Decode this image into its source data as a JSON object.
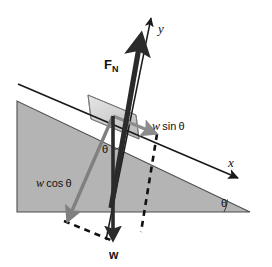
{
  "figure": {
    "kind": "free-body-diagram",
    "background_color": "#ffffff"
  },
  "colors": {
    "incline_fill": "#b4b4b4",
    "incline_stroke": "#4d4d4d",
    "block_fill": "#d8d8d8",
    "block_stroke": "#6e6e6e",
    "axis_line": "#1a1a1a",
    "normal_force_arrow": "#2b2b2b",
    "weight_arrow": "#2b2b2b",
    "wcos_arrow": "#808080",
    "wsin_arrow": "#8c8c8c",
    "dashed_line": "#111111",
    "text": "#111111"
  },
  "labels": {
    "y_axis": "y",
    "x_axis": "x",
    "normal_force": "F",
    "normal_force_sub": "N",
    "w_sin_var": "w",
    "w_sin_fn": "sin",
    "w_sin_theta": "θ",
    "w_cos_var": "w",
    "w_cos_fn": "cos",
    "w_cos_theta": "θ",
    "theta_block": "θ",
    "theta_incline": "θ",
    "weight": "w"
  },
  "geometry": {
    "incline": {
      "apex_right": [
        250,
        212
      ],
      "base_left": [
        17,
        212
      ],
      "top_left": [
        17,
        101
      ]
    },
    "surface_line": {
      "start": [
        18,
        84
      ],
      "end": [
        243,
        180
      ]
    },
    "incline_angle_degrees": 23,
    "block": {
      "center": [
        113,
        117
      ],
      "width": 48,
      "height": 40
    },
    "vectors": {
      "normal_force": {
        "from": [
          113,
          206
        ],
        "to": [
          142,
          30
        ],
        "label": "F_N"
      },
      "y_axis": {
        "from": [
          108,
          238
        ],
        "to": [
          152,
          14
        ],
        "label": "y"
      },
      "x_axis": {
        "from": [
          18,
          84
        ],
        "to": [
          243,
          180
        ],
        "label": "x"
      },
      "weight": {
        "from": [
          113,
          117
        ],
        "to": [
          113,
          243
        ],
        "label": "w"
      },
      "w_cos_theta": {
        "from": [
          113,
          117
        ],
        "to": [
          67,
          223
        ],
        "label": "w cos θ"
      },
      "w_sin_theta": {
        "from": [
          113,
          117
        ],
        "to": [
          158,
          136
        ],
        "label": "w sin θ"
      }
    },
    "dashed_paths": [
      {
        "from": [
          158,
          136
        ],
        "to": [
          140,
          235
        ]
      },
      {
        "from": [
          67,
          223
        ],
        "to": [
          113,
          243
        ]
      }
    ]
  }
}
